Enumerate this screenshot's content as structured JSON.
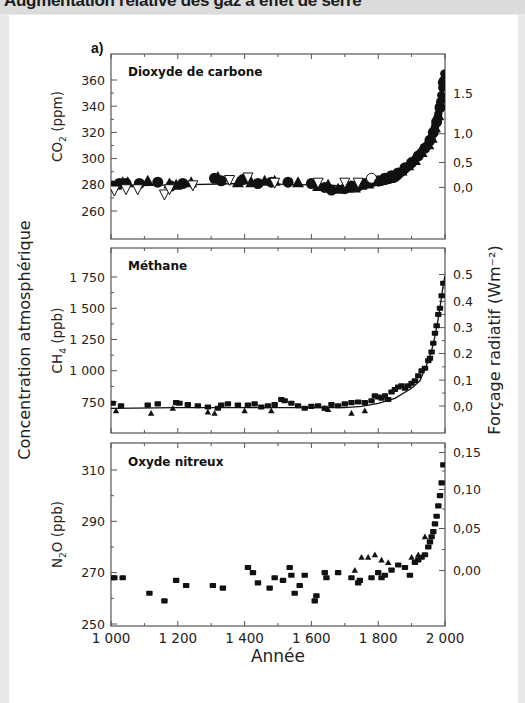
{
  "header": {
    "title": "Augmentation relative des gaz à effet de serre"
  },
  "figure": {
    "panel_letter": "a)",
    "x_axis_title": "Année",
    "left_axis_title": "Concentration atmosphérique",
    "right_axis_title": "Forçage radiatif (Wm⁻²)",
    "colors": {
      "ink": "#111111",
      "frame": "#555555",
      "background": "#ffffff",
      "page_margin": "#e9e9e9"
    }
  },
  "chart_data": [
    {
      "type": "scatter",
      "title": "Dioxyde de carbone",
      "xlabel": "Année",
      "ylabel": "CO₂ (ppm)",
      "y2label": "Forçage radiatif (Wm⁻²)",
      "xlim": [
        1000,
        2000
      ],
      "xticks": [
        1000,
        1200,
        1400,
        1600,
        1800,
        2000
      ],
      "ylim": [
        245,
        375
      ],
      "yticks": [
        260,
        280,
        300,
        320,
        340,
        360
      ],
      "y2ticks": [
        {
          "label": "1.5",
          "y": 349.4
        },
        {
          "label": "1,0",
          "y": 319.0
        },
        {
          "label": "0,5",
          "y": 297.0
        },
        {
          "label": "0,0",
          "y": 278.0
        }
      ],
      "grid": false,
      "series": [
        {
          "name": "carottes de glace (triangles pleins / points pleins)",
          "marker": "filled",
          "x": [
            1005,
            1015,
            1025,
            1035,
            1045,
            1050,
            1085,
            1110,
            1140,
            1175,
            1180,
            1195,
            1215,
            1240,
            1310,
            1320,
            1330,
            1380,
            1395,
            1420,
            1440,
            1460,
            1480,
            1490,
            1530,
            1560,
            1600,
            1620,
            1640,
            1650,
            1660,
            1680,
            1700,
            1710,
            1720,
            1730,
            1740,
            1750,
            1760,
            1770,
            1780,
            1790,
            1800,
            1810,
            1820,
            1830,
            1840,
            1850,
            1860,
            1870,
            1880,
            1890,
            1900,
            1910,
            1920,
            1930,
            1940,
            1950,
            1955,
            1960,
            1965,
            1970,
            1975,
            1980,
            1985,
            1990,
            1995
          ],
          "y": [
            279,
            280,
            281,
            282,
            281,
            282,
            281,
            283,
            282,
            281,
            279,
            280,
            281,
            282,
            285,
            286,
            283,
            282,
            284,
            282,
            281,
            283,
            282,
            283,
            282,
            282,
            281,
            279,
            278,
            280,
            276,
            277,
            277,
            278,
            279,
            278,
            279,
            280,
            281,
            281,
            282,
            283,
            283,
            284,
            285,
            286,
            287,
            288,
            289,
            291,
            293,
            295,
            297,
            299,
            302,
            305,
            308,
            311,
            314,
            316,
            320,
            324,
            328,
            333,
            339,
            346,
            358
          ]
        },
        {
          "name": "triangles vides",
          "marker": "open",
          "x": [
            1010,
            1045,
            1080,
            1160,
            1175,
            1245,
            1355,
            1410,
            1490,
            1620,
            1700,
            1740
          ],
          "y": [
            276,
            277,
            277,
            273,
            277,
            280,
            284,
            286,
            282,
            282,
            282,
            282
          ]
        },
        {
          "name": "cercle",
          "marker": "circle",
          "x": [
            1780
          ],
          "y": [
            285
          ]
        }
      ],
      "curve": {
        "x": [
          1000,
          1200,
          1400,
          1600,
          1750,
          1800,
          1850,
          1900,
          1925,
          1950,
          1960,
          1970,
          1980,
          1990,
          1995,
          2000
        ],
        "y": [
          279,
          280,
          281,
          280,
          279,
          282,
          285,
          296,
          304,
          311,
          316,
          324,
          334,
          350,
          360,
          368
        ]
      }
    },
    {
      "type": "scatter",
      "title": "Méthane",
      "xlabel": "Année",
      "ylabel": "CH₄ (ppb)",
      "y2label": "Forçage radiatif (Wm⁻²)",
      "xlim": [
        1000,
        2000
      ],
      "xticks": [
        1000,
        1200,
        1400,
        1600,
        1800,
        2000
      ],
      "ylim": [
        550,
        1950
      ],
      "yticks": [
        750,
        1000,
        1250,
        1500,
        1750
      ],
      "y2ticks": [
        {
          "label": "0.5",
          "y": 1770
        },
        {
          "label": "0.4",
          "y": 1555
        },
        {
          "label": "0.3",
          "y": 1345
        },
        {
          "label": "0.2",
          "y": 1138
        },
        {
          "label": "0,1",
          "y": 925
        },
        {
          "label": "0,0",
          "y": 718
        }
      ],
      "grid": false,
      "series": [
        {
          "name": "carrés pleins",
          "marker": "square",
          "x": [
            1005,
            1030,
            1110,
            1140,
            1195,
            1205,
            1230,
            1260,
            1290,
            1320,
            1330,
            1350,
            1380,
            1410,
            1430,
            1450,
            1470,
            1490,
            1510,
            1520,
            1540,
            1560,
            1580,
            1600,
            1620,
            1640,
            1660,
            1680,
            1700,
            1720,
            1740,
            1760,
            1780,
            1790,
            1800,
            1810,
            1820,
            1830,
            1840,
            1850,
            1860,
            1870,
            1880,
            1890,
            1900,
            1910,
            1920,
            1930,
            1940,
            1950,
            1955,
            1960,
            1965,
            1970,
            1975,
            1980,
            1985,
            1990,
            1995
          ],
          "y": [
            740,
            720,
            725,
            735,
            745,
            740,
            730,
            720,
            710,
            700,
            725,
            735,
            725,
            725,
            735,
            710,
            720,
            730,
            770,
            760,
            740,
            720,
            700,
            715,
            720,
            700,
            730,
            720,
            735,
            745,
            750,
            745,
            760,
            800,
            790,
            780,
            800,
            770,
            830,
            850,
            870,
            880,
            860,
            880,
            900,
            920,
            960,
            1000,
            1020,
            1080,
            1100,
            1150,
            1220,
            1300,
            1360,
            1450,
            1500,
            1600,
            1700
          ]
        },
        {
          "name": "triangles pleins",
          "marker": "triangle",
          "x": [
            1015,
            1120,
            1185,
            1290,
            1310,
            1400,
            1480,
            1640,
            1650,
            1720,
            1760
          ],
          "y": [
            680,
            660,
            700,
            670,
            660,
            680,
            680,
            700,
            690,
            660,
            680
          ]
        }
      ],
      "curve": {
        "x": [
          1000,
          1200,
          1400,
          1600,
          1700,
          1750,
          1800,
          1850,
          1900,
          1925,
          1950,
          1960,
          1970,
          1980,
          1990,
          1995,
          2000
        ],
        "y": [
          700,
          705,
          705,
          705,
          705,
          715,
          740,
          780,
          860,
          920,
          1080,
          1160,
          1280,
          1420,
          1600,
          1690,
          1760
        ]
      }
    },
    {
      "type": "scatter",
      "title": "Oxyde nitreux",
      "xlabel": "Année",
      "ylabel": "N₂O (ppb)",
      "y2label": "Forçage radiatif (Wm⁻²)",
      "xlim": [
        1000,
        2000
      ],
      "xticks": [
        1000,
        1200,
        1400,
        1600,
        1800,
        2000
      ],
      "ylim": [
        249,
        320
      ],
      "yticks": [
        250,
        270,
        290,
        310
      ],
      "y2ticks": [
        {
          "label": "0,15",
          "y": 316.8
        },
        {
          "label": "0,10",
          "y": 302.4
        },
        {
          "label": "0,05",
          "y": 287.2
        },
        {
          "label": "0,00",
          "y": 270.8
        }
      ],
      "grid": false,
      "series": [
        {
          "name": "points pleins",
          "marker": "square",
          "x": [
            1005,
            1010,
            1035,
            1115,
            1160,
            1195,
            1225,
            1305,
            1335,
            1410,
            1425,
            1440,
            1475,
            1490,
            1515,
            1535,
            1540,
            1550,
            1565,
            1580,
            1610,
            1615,
            1640,
            1645,
            1680,
            1720,
            1740,
            1745,
            1780,
            1800,
            1810,
            1820,
            1840,
            1860,
            1880,
            1895,
            1910,
            1920,
            1930,
            1940,
            1950,
            1955,
            1960,
            1965,
            1970,
            1975,
            1980,
            1985,
            1990,
            1995
          ],
          "y": [
            268,
            268,
            268,
            262,
            259,
            267,
            265,
            265,
            264,
            272,
            270,
            266,
            264,
            268,
            267,
            272,
            269,
            262,
            265,
            269,
            259,
            261,
            270,
            268,
            270,
            268,
            266,
            267,
            268,
            270,
            268,
            269,
            271,
            273,
            272,
            269,
            274,
            275,
            276,
            277,
            280,
            282,
            284,
            286,
            289,
            292,
            296,
            300,
            305,
            312
          ]
        },
        {
          "name": "triangles pleins",
          "marker": "triangle",
          "x": [
            1730,
            1750,
            1770,
            1790,
            1810,
            1830,
            1900,
            1920,
            1940
          ],
          "y": [
            271,
            276,
            276,
            277,
            275,
            274,
            276,
            277,
            284
          ]
        }
      ],
      "curve": null
    }
  ]
}
